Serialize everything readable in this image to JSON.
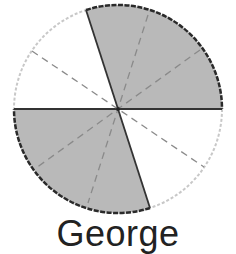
{
  "figure": {
    "label": "George",
    "total_parts": 12,
    "shaded_parts": 6,
    "fraction_shaded": "6/12",
    "colors": {
      "shaded_fill": "#b9b9b9",
      "unshaded_fill": "#ffffff",
      "shaded_edge": "#2a2a2a",
      "unshaded_edge": "#c8c8c8",
      "divider_solid": "#333333",
      "divider_dashed": "#8a8a8a"
    }
  }
}
